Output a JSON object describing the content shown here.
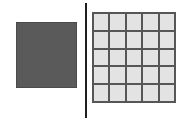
{
  "figure": {
    "title": "",
    "background_color": "#ffffff",
    "left_panel": {
      "shape_label": "",
      "fill_color": "#5a5a5a",
      "border_color": "#4a4a4a"
    },
    "divider": {
      "label": "",
      "color": "#1e1e1e"
    },
    "right_panel": {
      "shape_label": "",
      "rows": 5,
      "columns": 5,
      "cell_fill_color": "#e3e3e3",
      "grid_line_color": "#565656",
      "cells": [
        {
          "row": 1,
          "col": 1,
          "value": ""
        },
        {
          "row": 1,
          "col": 2,
          "value": ""
        },
        {
          "row": 1,
          "col": 3,
          "value": ""
        },
        {
          "row": 1,
          "col": 4,
          "value": ""
        },
        {
          "row": 1,
          "col": 5,
          "value": ""
        },
        {
          "row": 2,
          "col": 1,
          "value": ""
        },
        {
          "row": 2,
          "col": 2,
          "value": ""
        },
        {
          "row": 2,
          "col": 3,
          "value": ""
        },
        {
          "row": 2,
          "col": 4,
          "value": ""
        },
        {
          "row": 2,
          "col": 5,
          "value": ""
        },
        {
          "row": 3,
          "col": 1,
          "value": ""
        },
        {
          "row": 3,
          "col": 2,
          "value": ""
        },
        {
          "row": 3,
          "col": 3,
          "value": ""
        },
        {
          "row": 3,
          "col": 4,
          "value": ""
        },
        {
          "row": 3,
          "col": 5,
          "value": ""
        },
        {
          "row": 4,
          "col": 1,
          "value": ""
        },
        {
          "row": 4,
          "col": 2,
          "value": ""
        },
        {
          "row": 4,
          "col": 3,
          "value": ""
        },
        {
          "row": 4,
          "col": 4,
          "value": ""
        },
        {
          "row": 4,
          "col": 5,
          "value": ""
        },
        {
          "row": 5,
          "col": 1,
          "value": ""
        },
        {
          "row": 5,
          "col": 2,
          "value": ""
        },
        {
          "row": 5,
          "col": 3,
          "value": ""
        },
        {
          "row": 5,
          "col": 4,
          "value": ""
        },
        {
          "row": 5,
          "col": 5,
          "value": ""
        }
      ]
    }
  }
}
